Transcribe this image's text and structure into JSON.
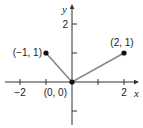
{
  "chart_data": {
    "type": "line",
    "title": "",
    "xlabel": "x",
    "ylabel": "y",
    "xlim": [
      -2.6,
      2.5
    ],
    "ylim": [
      -1.5,
      2.8
    ],
    "grid": false,
    "x_ticks": [
      -2,
      -1,
      1,
      2
    ],
    "x_tick_labels": [
      "−2",
      "",
      "",
      "2"
    ],
    "y_ticks": [
      2,
      1,
      -1
    ],
    "y_tick_labels": [
      "2",
      "",
      ""
    ],
    "series": [
      {
        "name": "y = |x| piecewise segments",
        "points": [
          {
            "x": -1,
            "y": 1,
            "label": "(−1, 1)"
          },
          {
            "x": 0,
            "y": 0,
            "label": "(0, 0)"
          },
          {
            "x": 2,
            "y": 1,
            "label": "(2, 1)"
          }
        ],
        "color": "#888888",
        "marker_color": "#111111"
      }
    ]
  },
  "colors": {
    "axis": "#333333",
    "line": "#888888",
    "point": "#111111"
  }
}
